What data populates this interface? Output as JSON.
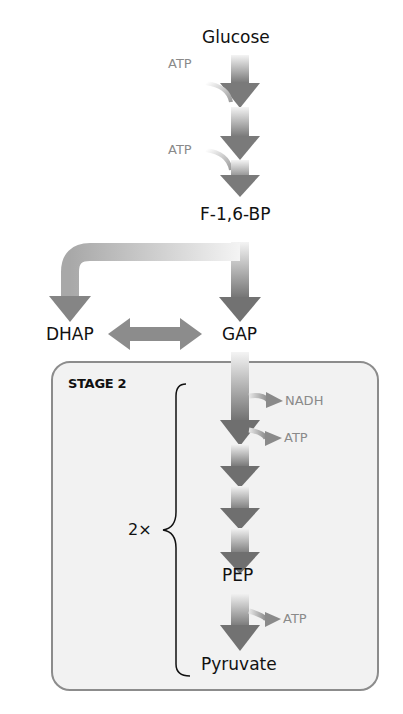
{
  "metabolites": {
    "glucose": "Glucose",
    "f16bp": "F-1,6-BP",
    "dhap": "DHAP",
    "gap": "GAP",
    "pep": "PEP",
    "pyruvate": "Pyruvate"
  },
  "inputs": {
    "atp1": "ATP",
    "atp2": "ATP"
  },
  "outputs": {
    "nadh": "NADH",
    "atp3": "ATP",
    "atp4": "ATP"
  },
  "stage2": {
    "title": "STAGE 2",
    "multiplier": "2×"
  },
  "colors": {
    "arrow_dark": "#6f6f6f",
    "arrow_light": "#f0f0f0",
    "box_fill": "#f2f2f2",
    "box_border": "#8c8c8c",
    "side_text": "#8a8a8a"
  }
}
